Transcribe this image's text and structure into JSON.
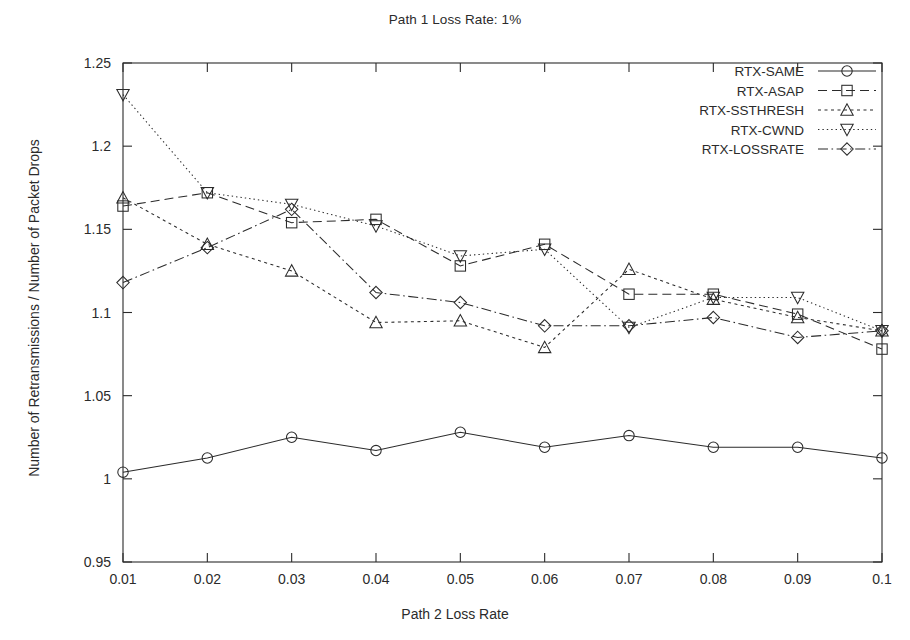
{
  "chart_data": {
    "type": "line",
    "title": "Path 1 Loss Rate: 1%",
    "xlabel": "Path 2 Loss Rate",
    "ylabel": "Number of Retransmissions / Number of Packet Drops",
    "x": [
      0.01,
      0.02,
      0.03,
      0.04,
      0.05,
      0.06,
      0.07,
      0.08,
      0.09,
      0.1
    ],
    "xticklabels": [
      "0.01",
      "0.02",
      "0.03",
      "0.04",
      "0.05",
      "0.06",
      "0.07",
      "0.08",
      "0.09",
      "0.1"
    ],
    "yticklabels": [
      "0.95",
      "1",
      "1.05",
      "1.1",
      "1.15",
      "1.2",
      "1.25"
    ],
    "yticks": [
      0.95,
      1.0,
      1.05,
      1.1,
      1.15,
      1.2,
      1.25
    ],
    "xlim": [
      0.01,
      0.1
    ],
    "ylim": [
      0.95,
      1.25
    ],
    "grid": false,
    "legend_position": "top-right",
    "series": [
      {
        "name": "RTX-SAME",
        "marker": "circle",
        "dash": "solid",
        "values": [
          1.004,
          1.0125,
          1.025,
          1.017,
          1.028,
          1.019,
          1.026,
          1.019,
          1.019,
          1.0125
        ]
      },
      {
        "name": "RTX-ASAP",
        "marker": "square",
        "dash": "dashed",
        "values": [
          1.164,
          1.172,
          1.154,
          1.156,
          1.128,
          1.141,
          1.111,
          1.111,
          1.099,
          1.078
        ]
      },
      {
        "name": "RTX-SSTHRESH",
        "marker": "triangle-up",
        "dash": "dotted",
        "values": [
          1.169,
          1.141,
          1.125,
          1.094,
          1.095,
          1.079,
          1.126,
          1.108,
          1.097,
          1.089
        ]
      },
      {
        "name": "RTX-CWND",
        "marker": "triangle-down",
        "dash": "fine-dotted",
        "values": [
          1.231,
          1.172,
          1.165,
          1.152,
          1.134,
          1.138,
          1.091,
          1.109,
          1.109,
          1.089
        ]
      },
      {
        "name": "RTX-LOSSRATE",
        "marker": "diamond",
        "dash": "dash-dot",
        "values": [
          1.118,
          1.139,
          1.162,
          1.112,
          1.106,
          1.092,
          1.092,
          1.097,
          1.085,
          1.089
        ]
      }
    ]
  }
}
